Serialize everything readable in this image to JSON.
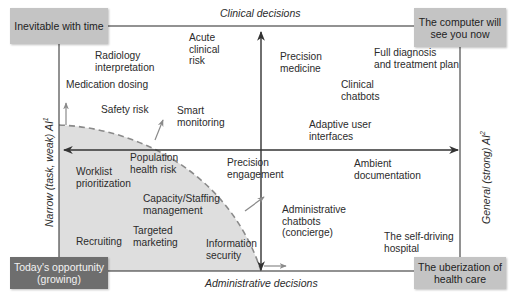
{
  "diagram": {
    "type": "2x2 matrix",
    "axes": {
      "top": "Clinical decisions",
      "bottom": "Administrative decisions",
      "left": "Narrow (task, weak) AI",
      "left_sup": "1",
      "right": "General (strong) AI",
      "right_sup": "2"
    },
    "corners": {
      "top_left": "Inevitable with time",
      "top_right": "The computer will\nsee you now",
      "bottom_left": "Today's opportunity\n(growing)",
      "bottom_right": "The uberization of\nhealth care"
    },
    "items": [
      {
        "label": "Radiology\ninterpretation",
        "quadrant": "narrow-clinical"
      },
      {
        "label": "Acute\nclinical\nrisk",
        "quadrant": "narrow-clinical"
      },
      {
        "label": "Medication dosing",
        "quadrant": "narrow-clinical"
      },
      {
        "label": "Safety risk",
        "quadrant": "narrow-clinical"
      },
      {
        "label": "Smart\nmonitoring",
        "quadrant": "narrow-clinical"
      },
      {
        "label": "Precision\nmedicine",
        "quadrant": "general-clinical"
      },
      {
        "label": "Full diagnosis\nand treatment plan",
        "quadrant": "general-clinical"
      },
      {
        "label": "Clinical\nchatbots",
        "quadrant": "general-clinical"
      },
      {
        "label": "Adaptive user\ninterfaces",
        "quadrant": "general-clinical"
      },
      {
        "label": "Worklist\nprioritization",
        "quadrant": "narrow-administrative"
      },
      {
        "label": "Population\nhealth risk",
        "quadrant": "narrow-administrative"
      },
      {
        "label": "Capacity/Staffing\nmanagement",
        "quadrant": "narrow-administrative"
      },
      {
        "label": "Recruiting",
        "quadrant": "narrow-administrative"
      },
      {
        "label": "Targeted\nmarketing",
        "quadrant": "narrow-administrative"
      },
      {
        "label": "Information\nsecurity",
        "quadrant": "narrow-administrative"
      },
      {
        "label": "Precision\nengagement",
        "quadrant": "general-administrative"
      },
      {
        "label": "Ambient\ndocumentation",
        "quadrant": "general-administrative"
      },
      {
        "label": "Administrative\nchatbots\n(concierge)",
        "quadrant": "general-administrative"
      },
      {
        "label": "The self-driving\nhospital",
        "quadrant": "general-administrative"
      }
    ],
    "colors": {
      "frame": "#3a3a3a",
      "shaded_region": "#dcdcdc",
      "dashed_curve": "#8a8a8a",
      "corner_box_light": "#c4c4c4",
      "corner_box_dark": "#6e6e6e",
      "growth_arrows": "#8a8a8a"
    }
  }
}
